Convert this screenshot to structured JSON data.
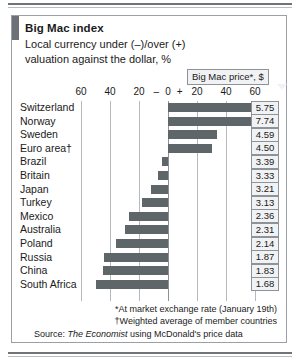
{
  "chart_data": {
    "type": "bar",
    "title": "Big Mac index",
    "subtitle_line1": "Local currency under (–)/over (+)",
    "subtitle_line2": "valuation against the dollar, %",
    "orientation": "horizontal",
    "xlabel": "",
    "ylabel": "",
    "xlim": [
      -70,
      70
    ],
    "grid": true,
    "gridlines": [
      -60,
      -40,
      -20,
      0,
      20,
      40,
      60
    ],
    "axis_ticks": [
      "60",
      "40",
      "20",
      "–",
      "0",
      "+",
      "20",
      "40",
      "60"
    ],
    "axis_tick_values": [
      -60,
      -40,
      -20,
      -8,
      0,
      8,
      20,
      40,
      60
    ],
    "legend_position": "none",
    "bar_color": "#5f6669",
    "categories": [
      "Switzerland",
      "Norway",
      "Sweden",
      "Euro area†",
      "Brazil",
      "Britain",
      "Japan",
      "Turkey",
      "Mexico",
      "Australia",
      "Poland",
      "Russia",
      "China",
      "South Africa"
    ],
    "values": [
      62,
      62,
      34,
      30,
      -4,
      -7,
      -12,
      -18,
      -27,
      -30,
      -36,
      -44,
      -45,
      -50
    ],
    "series": [
      {
        "name": "Big Mac index valuation vs dollar, %",
        "values": [
          62,
          62,
          34,
          30,
          -4,
          -7,
          -12,
          -18,
          -27,
          -30,
          -36,
          -44,
          -45,
          -50
        ]
      }
    ],
    "annotations": {
      "price_column_header": "Big Mac price*, $",
      "price_values": [
        "5.75",
        "7.74",
        "4.59",
        "4.50",
        "3.39",
        "3.33",
        "3.21",
        "3.13",
        "2.36",
        "2.31",
        "2.14",
        "1.87",
        "1.83",
        "1.68"
      ]
    }
  },
  "chart": {
    "title": "Big Mac index",
    "subtitle1": "Local currency under (–)/over (+)",
    "subtitle2": "valuation against the dollar, %",
    "price_callout": "Big Mac price*, $",
    "axis_ticks": [
      "60",
      "40",
      "20",
      "–",
      "0",
      "+",
      "20",
      "40",
      "60"
    ],
    "rows": [
      {
        "country": "Switzerland",
        "value": 62,
        "price": "5.75"
      },
      {
        "country": "Norway",
        "value": 62,
        "price": "7.74"
      },
      {
        "country": "Sweden",
        "value": 34,
        "price": "4.59"
      },
      {
        "country": "Euro area†",
        "value": 30,
        "price": "4.50"
      },
      {
        "country": "Brazil",
        "value": -4,
        "price": "3.39"
      },
      {
        "country": "Britain",
        "value": -7,
        "price": "3.33"
      },
      {
        "country": "Japan",
        "value": -12,
        "price": "3.21"
      },
      {
        "country": "Turkey",
        "value": -18,
        "price": "3.13"
      },
      {
        "country": "Mexico",
        "value": -27,
        "price": "2.36"
      },
      {
        "country": "Australia",
        "value": -30,
        "price": "2.31"
      },
      {
        "country": "Poland",
        "value": -36,
        "price": "2.14"
      },
      {
        "country": "Russia",
        "value": -44,
        "price": "1.87"
      },
      {
        "country": "China",
        "value": -45,
        "price": "1.83"
      },
      {
        "country": "South Africa",
        "value": -50,
        "price": "1.68"
      }
    ]
  },
  "footnotes": {
    "note1": "*At market exchange rate (January 19th)",
    "note2": "†Weighted average of member countries",
    "source_prefix": "Source: ",
    "source_name": "The Economist",
    "source_suffix": " using McDonald's price data"
  },
  "colors": {
    "bar": "#5f6669",
    "accent": "#6d7276",
    "grid": "#b5babe",
    "frame": "#9aa0a5",
    "box_fill": "#f1f2f3"
  }
}
